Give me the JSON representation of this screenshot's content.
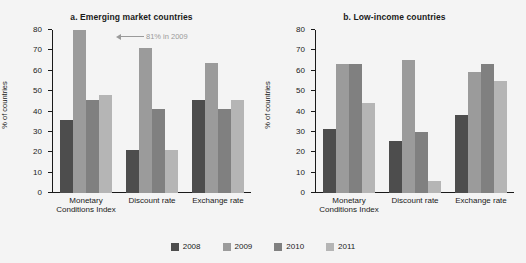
{
  "chart_data": {
    "type": "bar",
    "title": "",
    "ylabel": "% of countries",
    "xlabel": "",
    "ylim": [
      0,
      80
    ],
    "yticks": [
      0,
      10,
      20,
      30,
      40,
      50,
      60,
      70,
      80
    ],
    "grid": false,
    "legend_position": "bottom",
    "categories": [
      "Monetary Conditions Index",
      "Discount rate",
      "Exchange rate"
    ],
    "legend": [
      "2008",
      "2009",
      "2010",
      "2011"
    ],
    "colors": {
      "2008": "#4d4d4d",
      "2009": "#9b9b9b",
      "2010": "#808080",
      "2011": "#b5b5b5",
      "background": "#f4f4f4",
      "axis": "#1a1a1a",
      "annotation": "#9a9a9a"
    },
    "panels": [
      {
        "title": "a. Emerging market countries",
        "categories": [
          "Monetary Conditions Index",
          "Discount rate",
          "Exchange rate"
        ],
        "series": [
          {
            "name": "2008",
            "values": [
              36,
              21,
              45.5
            ]
          },
          {
            "name": "2009",
            "values": [
              81,
              71,
              64
            ]
          },
          {
            "name": "2010",
            "values": [
              45.5,
              41,
              41
            ]
          },
          {
            "name": "2011",
            "values": [
              48,
              21,
              45.5
            ]
          }
        ],
        "annotation": {
          "text": "81% in 2009",
          "arrow": "left-arrow-icon"
        }
      },
      {
        "title": "b. Low-income countries",
        "categories": [
          "Monetary Conditions Index",
          "Discount rate",
          "Exchange rate"
        ],
        "series": [
          {
            "name": "2008",
            "values": [
              31.5,
              25.5,
              38.5
            ]
          },
          {
            "name": "2009",
            "values": [
              63.5,
              65.5,
              59.5
            ]
          },
          {
            "name": "2010",
            "values": [
              63.5,
              30,
              63.5
            ]
          },
          {
            "name": "2011",
            "values": [
              44,
              6,
              55
            ]
          }
        ],
        "annotation": null
      }
    ]
  }
}
